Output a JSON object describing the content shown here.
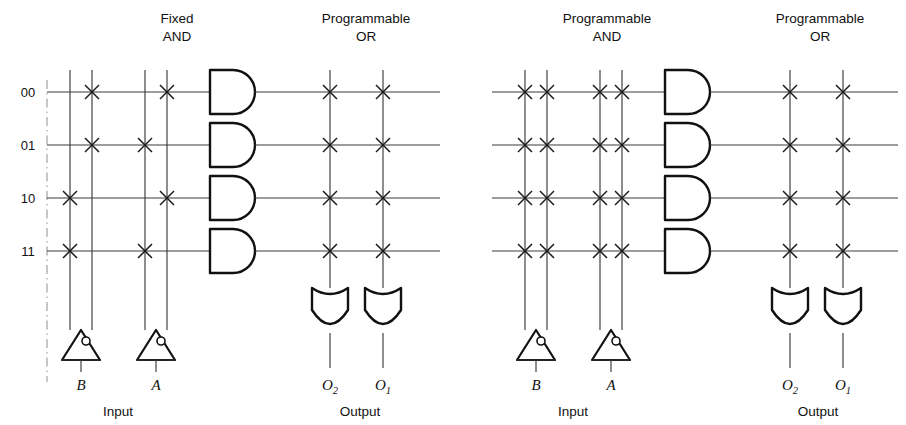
{
  "figure": {
    "type": "logic-array-diagram",
    "panels": [
      {
        "id": "left",
        "and_plane_heading": {
          "line1": "Fixed",
          "line2": "AND"
        },
        "or_plane_heading": {
          "line1": "Programmable",
          "line2": "OR"
        },
        "row_labels": [
          "00",
          "01",
          "10",
          "11"
        ],
        "input_labels": [
          "B",
          "A"
        ],
        "input_footer": "Input",
        "output_labels": [
          {
            "base": "O",
            "sub": "2"
          },
          {
            "base": "O",
            "sub": "1"
          }
        ],
        "output_footer": "Output",
        "and_columns": [
          "B",
          "B-bar",
          "A",
          "A-bar"
        ],
        "and_crosspoints": [
          [
            0,
            1,
            0,
            1
          ],
          [
            0,
            1,
            1,
            0
          ],
          [
            1,
            0,
            0,
            1
          ],
          [
            1,
            0,
            1,
            0
          ]
        ],
        "or_columns": [
          "O2",
          "O1"
        ],
        "or_crosspoints": [
          [
            1,
            1
          ],
          [
            1,
            1
          ],
          [
            1,
            1
          ],
          [
            1,
            1
          ]
        ],
        "and_gate_count": 4,
        "or_gate_count": 2
      },
      {
        "id": "right",
        "and_plane_heading": {
          "line1": "Programmable",
          "line2": "AND"
        },
        "or_plane_heading": {
          "line1": "Programmable",
          "line2": "OR"
        },
        "row_labels": [],
        "input_labels": [
          "B",
          "A"
        ],
        "input_footer": "Input",
        "output_labels": [
          {
            "base": "O",
            "sub": "2"
          },
          {
            "base": "O",
            "sub": "1"
          }
        ],
        "output_footer": "Output",
        "and_columns": [
          "B",
          "B-bar",
          "A",
          "A-bar"
        ],
        "and_crosspoints": [
          [
            1,
            1,
            1,
            1
          ],
          [
            1,
            1,
            1,
            1
          ],
          [
            1,
            1,
            1,
            1
          ],
          [
            1,
            1,
            1,
            1
          ]
        ],
        "or_columns": [
          "O2",
          "O1"
        ],
        "or_crosspoints": [
          [
            1,
            1
          ],
          [
            1,
            1
          ],
          [
            1,
            1
          ],
          [
            1,
            1
          ]
        ],
        "and_gate_count": 4,
        "or_gate_count": 2
      }
    ],
    "colors": {
      "ink": "#111111",
      "wire": "#3a3a3a",
      "background": "#ffffff",
      "guide": "#9a9a9a"
    }
  }
}
